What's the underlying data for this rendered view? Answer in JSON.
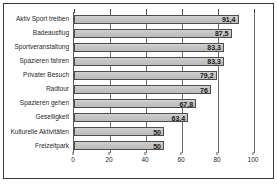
{
  "chart_data": {
    "type": "bar",
    "orientation": "horizontal",
    "title": "",
    "subtitle": "",
    "xlabel": "",
    "ylabel": "",
    "xlim": [
      0,
      100
    ],
    "xticks": [
      0,
      20,
      40,
      60,
      80,
      100
    ],
    "xtick_labels": [
      "0",
      "20",
      "40",
      "60",
      "80",
      "100"
    ],
    "grid": true,
    "legend": "none",
    "decimal_separator": ",",
    "categories": [
      "Aktiv Sport treiben",
      "Badeausflug",
      "Sportveranstaltung",
      "Spazieren fahren",
      "Privater Besuch",
      "Radtour",
      "Spazieren gehen",
      "Geselligkeit",
      "Kulturelle Aktivitäten",
      "Freizeitpark"
    ],
    "values": [
      91.4,
      87.5,
      83.3,
      83.3,
      79.2,
      76,
      67.8,
      63.4,
      50,
      50
    ],
    "value_labels": [
      "91,4",
      "87,5",
      "83,3",
      "83,3",
      "79,2",
      "76",
      "67,8",
      "63,4",
      "50",
      "50"
    ],
    "colors": {
      "bar_fill": "#c6c6c6",
      "bar_border": "#4e4e4e",
      "gridline": "#6b6b6b",
      "axis": "#5a5a5a",
      "text": "#1f1f1f",
      "frame": "#3a3a3a",
      "background": "#ffffff"
    }
  }
}
